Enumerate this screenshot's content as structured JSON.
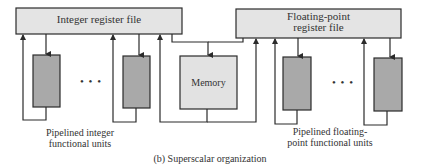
{
  "diagram": {
    "caption": "(b) Superscalar organization",
    "integer_register_file": {
      "label": "Integer register file"
    },
    "fp_register_file": {
      "line1": "Floating-point",
      "line2": "register file"
    },
    "memory": {
      "label": "Memory"
    },
    "integer_units_label": {
      "line1": "Pipelined integer",
      "line2": "functional units"
    },
    "fp_units_label": {
      "line1": "Pipelined floating-",
      "line2": "point functional units"
    },
    "ellipsis": "• • •",
    "colors": {
      "register_fill": "#e4e4e4",
      "unit_fill": "#a9a9a9",
      "memory_fill": "#e2e2e2",
      "stroke": "#2b2b2b"
    }
  }
}
